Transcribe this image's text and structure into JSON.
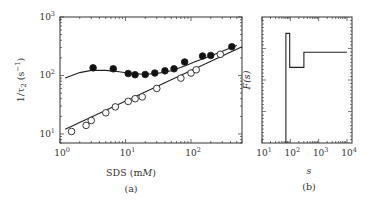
{
  "chart_data": [
    {
      "panel": "(a)",
      "type": "scatter",
      "title": "",
      "xlabel": "SDS (mM)",
      "ylabel": "1/τ2 (s⁻¹)",
      "xscale": "log",
      "yscale": "log",
      "xlim": [
        1,
        600
      ],
      "ylim": [
        7,
        1000
      ],
      "xticks": [
        "10^0",
        "10^1",
        "10^2"
      ],
      "yticks": [
        "10^1",
        "10^2",
        "10^3"
      ],
      "grid": false,
      "legend": null,
      "series": [
        {
          "name": "filled circles",
          "marker": "filled-circle",
          "x": [
            3.2,
            6.5,
            11,
            14,
            20,
            28,
            40,
            55,
            80,
            150,
            200,
            420
          ],
          "y": [
            135,
            130,
            108,
            103,
            104,
            110,
            120,
            130,
            170,
            215,
            220,
            310
          ]
        },
        {
          "name": "open circles",
          "marker": "open-circle",
          "x": [
            1.5,
            2.5,
            3,
            5,
            7,
            11,
            14,
            18,
            30,
            70,
            100,
            120,
            280
          ],
          "y": [
            11,
            14,
            17,
            23,
            29,
            36,
            40,
            43,
            60,
            90,
            110,
            125,
            230
          ]
        },
        {
          "name": "fit curve (filled)",
          "marker": "line",
          "x": [
            1.2,
            2,
            3,
            5,
            8,
            12,
            20,
            30,
            50,
            80,
            120,
            200,
            300,
            500
          ],
          "y": [
            90,
            112,
            122,
            122,
            116,
            108,
            105,
            108,
            120,
            145,
            175,
            215,
            260,
            330
          ]
        },
        {
          "name": "fit line (open)",
          "marker": "line",
          "x": [
            1.2,
            600
          ],
          "y": [
            12,
            310
          ]
        }
      ]
    },
    {
      "panel": "(b)",
      "type": "line",
      "title": "",
      "xlabel": "s",
      "ylabel": "F(s)",
      "xscale": "log",
      "xlim": [
        10,
        15000
      ],
      "xticks": [
        "10^1",
        "10^2",
        "10^3",
        "10^4"
      ],
      "grid": false,
      "legend": null,
      "series": [
        {
          "name": "F(s) step function",
          "x": [
            70,
            70,
            95,
            95,
            300,
            300,
            10000
          ],
          "y_rel": [
            0.0,
            0.87,
            0.87,
            0.6,
            0.6,
            0.72,
            0.72
          ]
        }
      ]
    }
  ],
  "labels": {
    "a_ylabel_main": "1/τ",
    "a_ylabel_sub": "2",
    "a_ylabel_unit": " (s",
    "a_ylabel_sup": "−1",
    "a_ylabel_close": ")",
    "a_xlabel_main": "SDS (m",
    "a_xlabel_italic": "M",
    "a_xlabel_close": ")",
    "a_panel": "(a)",
    "b_ylabel": "F(s)",
    "b_xlabel": "s",
    "b_panel": "(b)",
    "tick_base": "10",
    "a_x_exps": [
      "0",
      "1",
      "2"
    ],
    "a_y_exps": [
      "1",
      "2",
      "3"
    ],
    "b_x_exps": [
      "1",
      "2",
      "3",
      "4"
    ]
  }
}
